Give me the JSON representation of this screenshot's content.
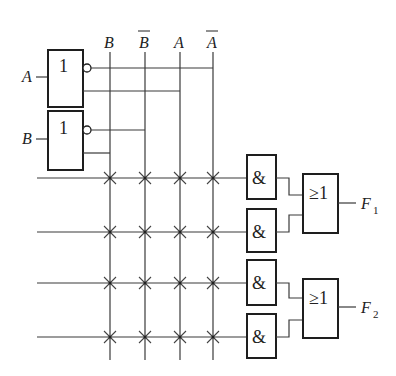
{
  "diagram": {
    "title": "",
    "inputs": [
      {
        "label": "A",
        "gate_symbol": "1"
      },
      {
        "label": "B",
        "gate_symbol": "1"
      }
    ],
    "columns": [
      {
        "label": "B",
        "overline": false
      },
      {
        "label": "B",
        "overline": true
      },
      {
        "label": "A",
        "overline": false
      },
      {
        "label": "A",
        "overline": true
      }
    ],
    "and_gates": [
      {
        "symbol": "&"
      },
      {
        "symbol": "&"
      },
      {
        "symbol": "&"
      },
      {
        "symbol": "&"
      }
    ],
    "or_gates": [
      {
        "symbol": "≥1",
        "output": "F",
        "subscript": "1"
      },
      {
        "symbol": "≥1",
        "output": "F",
        "subscript": "2"
      }
    ],
    "connections_marker": "×",
    "colors": {
      "line": "#3a3a3a",
      "gate": "#1e1e1e",
      "background": "#ffffff"
    }
  }
}
